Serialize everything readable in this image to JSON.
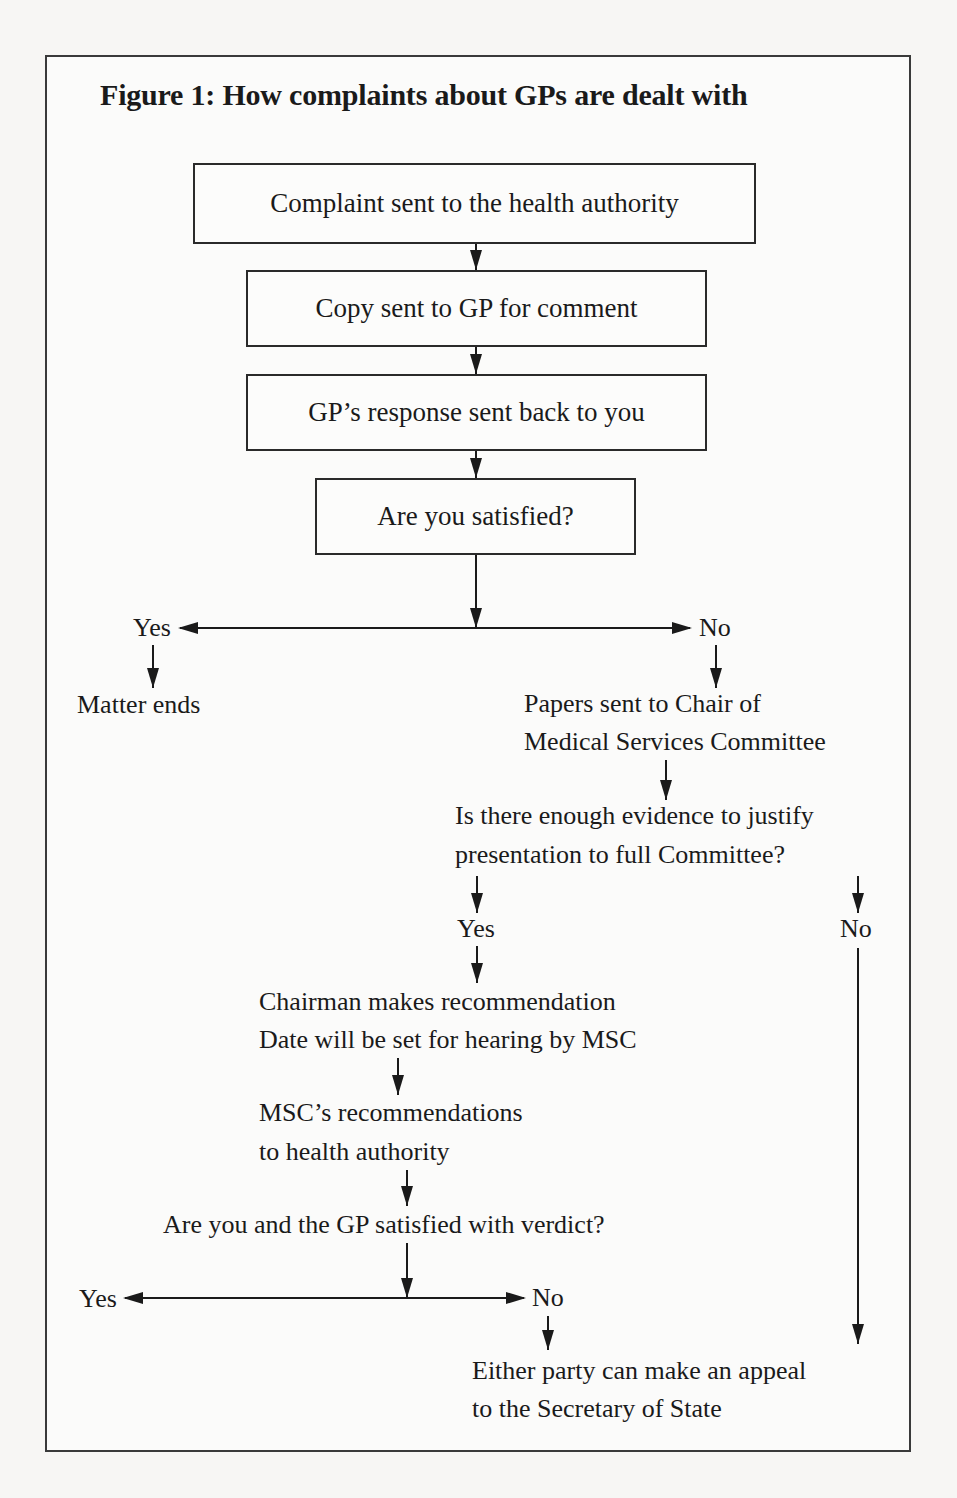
{
  "figure": {
    "title": "Figure 1: How complaints about GPs are dealt with",
    "boxes": [
      {
        "id": "b1",
        "label": "Complaint sent to the health authority"
      },
      {
        "id": "b2",
        "label": "Copy sent to GP for comment"
      },
      {
        "id": "b3",
        "label": "GP’s response sent back to you"
      },
      {
        "id": "b4",
        "label": "Are you satisfied?"
      }
    ],
    "branch1": {
      "yes": "Yes",
      "no": "No",
      "yes_result": "Matter ends",
      "no_result_line1": "Papers sent to Chair of",
      "no_result_line2": "Medical Services Committee"
    },
    "question2": {
      "line1": "Is there enough evidence to justify",
      "line2": "presentation to full Committee?",
      "yes": "Yes",
      "no": "No"
    },
    "chairman": {
      "line1": "Chairman makes recommendation",
      "line2": "Date will be set for hearing by MSC"
    },
    "msc": {
      "line1": "MSC’s recommendations",
      "line2": "to health authority"
    },
    "question3": {
      "text": "Are you and the GP satisfied with verdict?",
      "yes": "Yes",
      "no": "No"
    },
    "appeal": {
      "line1": "Either party can make an appeal",
      "line2": "to the Secretary of State"
    },
    "colors": {
      "line": "#1a1a1a",
      "border": "#3a3a3a",
      "background": "#f7f6f4"
    }
  }
}
